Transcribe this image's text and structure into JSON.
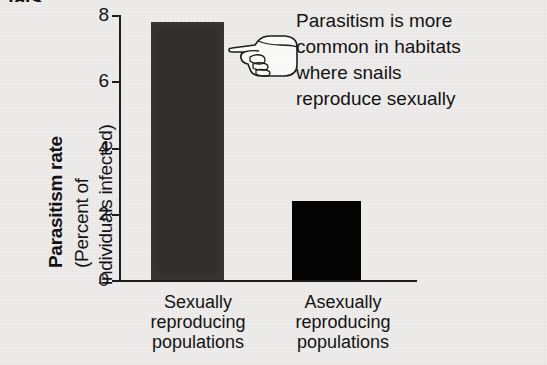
{
  "figure": {
    "caption_fragment": "tats.",
    "background_color": "#edecea"
  },
  "annotation": {
    "text": "Parasitism is more\ncommon in habitats\nwhere snails\nreproduce sexually",
    "pointer_icon": "pointing-hand-left-icon"
  },
  "chart_data": {
    "type": "bar",
    "title": "",
    "xlabel": "",
    "ylabel": "Parasitism rate (Percent of individuals infected)",
    "ylabel_title": "Parasitism rate",
    "ylabel_sub_line1": "(Percent of",
    "ylabel_sub_line2": "individuals infected)",
    "categories": [
      "Sexually\nreproducing\npopulations",
      "Asexually\nreproducing\npopulations"
    ],
    "values": [
      7.8,
      2.4
    ],
    "bar_colors": [
      "#333130",
      "#040404"
    ],
    "ylim": [
      0,
      8
    ],
    "yticks": [
      0,
      2,
      4,
      6,
      8
    ],
    "ytick_labels": [
      "0",
      "2",
      "4",
      "6",
      "8"
    ],
    "grid": false,
    "legend": "none"
  }
}
